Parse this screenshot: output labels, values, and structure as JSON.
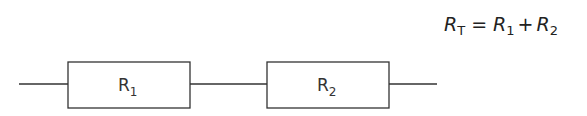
{
  "diagram": {
    "type": "series-circuit",
    "components": [
      {
        "id": "R1",
        "label_main": "R",
        "label_sub": "1"
      },
      {
        "id": "R2",
        "label_main": "R",
        "label_sub": "2"
      }
    ],
    "formula": {
      "lhs_main": "R",
      "lhs_sub": "T",
      "equals": "=",
      "t1_main": "R",
      "t1_sub": "1",
      "plus": "+",
      "t2_main": "R",
      "t2_sub": "2"
    }
  }
}
